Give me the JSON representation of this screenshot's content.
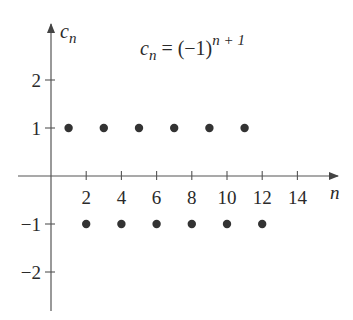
{
  "chart_data": {
    "type": "scatter",
    "formula": {
      "lhs": "c",
      "lhs_sub": "n",
      "eq": " = (−1)",
      "exp": "n + 1"
    },
    "xlabel": "n",
    "ylabel": {
      "base": "c",
      "sub": "n"
    },
    "xlim": [
      0,
      15
    ],
    "ylim": [
      -2.5,
      3
    ],
    "grid": false,
    "legend": "none",
    "x_ticks": [
      2,
      4,
      6,
      8,
      10,
      12,
      14
    ],
    "x_tick_labels": [
      "2",
      "4",
      "6",
      "8",
      "10",
      "12",
      "14"
    ],
    "y_ticks": [
      2,
      1,
      -1,
      -2
    ],
    "y_tick_labels": [
      "2",
      "1",
      "−1",
      "−2"
    ],
    "points": [
      {
        "x": 1,
        "y": 1
      },
      {
        "x": 2,
        "y": -1
      },
      {
        "x": 3,
        "y": 1
      },
      {
        "x": 4,
        "y": -1
      },
      {
        "x": 5,
        "y": 1
      },
      {
        "x": 6,
        "y": -1
      },
      {
        "x": 7,
        "y": 1
      },
      {
        "x": 8,
        "y": -1
      },
      {
        "x": 9,
        "y": 1
      },
      {
        "x": 10,
        "y": -1
      },
      {
        "x": 11,
        "y": 1
      },
      {
        "x": 12,
        "y": -1
      }
    ],
    "series": [
      {
        "name": "c_n",
        "x": [
          1,
          2,
          3,
          4,
          5,
          6,
          7,
          8,
          9,
          10,
          11,
          12
        ],
        "values": [
          1,
          -1,
          1,
          -1,
          1,
          -1,
          1,
          -1,
          1,
          -1,
          1,
          -1
        ]
      }
    ]
  },
  "colors": {
    "ink": "#2a2a2a",
    "axis": "#555555",
    "point": "#333333"
  }
}
